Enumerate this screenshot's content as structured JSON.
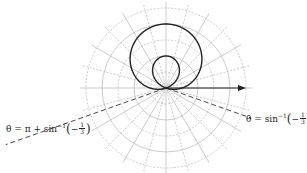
{
  "diagram": {
    "type": "polar-plot",
    "curve": "limacon r = 1 + 3 sin θ",
    "pole": {
      "x": 166,
      "y": 88
    },
    "scale_px_per_unit": 16,
    "grid_circles": [
      1,
      2,
      3,
      4,
      5
    ],
    "radial_step_deg": 15,
    "colors": {
      "curve": "#222222",
      "grid": "#b5b5b5",
      "dashed": "#333333"
    }
  },
  "labels": {
    "left": {
      "prefix": "θ = π + sin",
      "sup": "−1",
      "neg": "−",
      "num": "1",
      "den": "3"
    },
    "right": {
      "prefix": "θ = sin",
      "sup": "−1",
      "neg": "−",
      "num": "1",
      "den": "3"
    }
  }
}
